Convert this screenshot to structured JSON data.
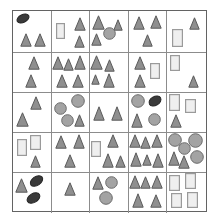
{
  "figure": {
    "kind": "shape-count-grid",
    "width": 217,
    "height": 221,
    "background_color": "#ffffff",
    "outer_border_color": "#636363",
    "grid_line_color": "#8c8c8c",
    "rows": 5,
    "columns": 5,
    "grid": {
      "left": 12,
      "top": 10,
      "width": 195,
      "height": 202,
      "row_heights": [
        42,
        40,
        40,
        40,
        40
      ],
      "column_widths": [
        39,
        39,
        39,
        39,
        39
      ]
    }
  },
  "palette": {
    "triangle_fill": "#8f8f8f",
    "triangle_stroke": "#5a5a5a",
    "circle_fill": "#a3a3a3",
    "circle_stroke": "#6b6b6b",
    "ellipse_fill": "#3a3a3a",
    "ellipse_stroke": "#262626",
    "rect_fill": "#efefef",
    "rect_stroke": "#9a9a9a"
  },
  "legend": {
    "shape_names": [
      "triangle",
      "circle",
      "ellipse",
      "rectangle"
    ]
  },
  "chart_data": {
    "type": "table",
    "title": "",
    "xlabel": "",
    "ylabel": "",
    "categories": [
      "triangle",
      "circle",
      "ellipse",
      "rectangle"
    ],
    "cells": [
      {
        "row": 1,
        "col": 1,
        "counts": {
          "triangle": 2,
          "circle": 0,
          "ellipse": 1,
          "rectangle": 0
        },
        "shapes": [
          {
            "type": "ellipse",
            "x": 3,
            "y": 3,
            "w": 14,
            "h": 9,
            "rot": -25
          },
          {
            "type": "triangle",
            "x": 7,
            "y": 22,
            "w": 12,
            "h": 14
          },
          {
            "type": "triangle",
            "x": 21,
            "y": 22,
            "w": 12,
            "h": 14
          }
        ]
      },
      {
        "row": 1,
        "col": 2,
        "counts": {
          "triangle": 2,
          "circle": 0,
          "ellipse": 0,
          "rectangle": 1
        },
        "shapes": [
          {
            "type": "rect",
            "x": 4,
            "y": 12,
            "w": 9,
            "h": 16
          },
          {
            "type": "triangle",
            "x": 22,
            "y": 6,
            "w": 12,
            "h": 14
          },
          {
            "type": "triangle",
            "x": 22,
            "y": 24,
            "w": 11,
            "h": 13
          }
        ]
      },
      {
        "row": 1,
        "col": 3,
        "counts": {
          "triangle": 3,
          "circle": 1,
          "ellipse": 0,
          "rectangle": 0
        },
        "shapes": [
          {
            "type": "triangle",
            "x": 2,
            "y": 4,
            "w": 13,
            "h": 15
          },
          {
            "type": "triangle",
            "x": 23,
            "y": 8,
            "w": 10,
            "h": 12
          },
          {
            "type": "circle",
            "x": 13,
            "y": 16,
            "w": 13,
            "h": 13
          },
          {
            "type": "triangle",
            "x": 1,
            "y": 22,
            "w": 11,
            "h": 13
          }
        ]
      },
      {
        "row": 1,
        "col": 4,
        "counts": {
          "triangle": 3,
          "circle": 0,
          "ellipse": 0,
          "rectangle": 0
        },
        "shapes": [
          {
            "type": "triangle",
            "x": 4,
            "y": 5,
            "w": 12,
            "h": 14
          },
          {
            "type": "triangle",
            "x": 21,
            "y": 4,
            "w": 12,
            "h": 14
          },
          {
            "type": "triangle",
            "x": 13,
            "y": 23,
            "w": 11,
            "h": 13
          }
        ]
      },
      {
        "row": 1,
        "col": 5,
        "counts": {
          "triangle": 1,
          "circle": 0,
          "ellipse": 0,
          "rectangle": 1
        },
        "shapes": [
          {
            "type": "triangle",
            "x": 22,
            "y": 6,
            "w": 11,
            "h": 13
          },
          {
            "type": "rect",
            "x": 5,
            "y": 18,
            "w": 11,
            "h": 18
          }
        ]
      },
      {
        "row": 2,
        "col": 1,
        "counts": {
          "triangle": 2,
          "circle": 0,
          "ellipse": 0,
          "rectangle": 0
        },
        "shapes": [
          {
            "type": "triangle",
            "x": 15,
            "y": 3,
            "w": 12,
            "h": 14
          },
          {
            "type": "triangle",
            "x": 12,
            "y": 21,
            "w": 12,
            "h": 14
          }
        ]
      },
      {
        "row": 2,
        "col": 2,
        "counts": {
          "triangle": 5,
          "circle": 0,
          "ellipse": 0,
          "rectangle": 0
        },
        "shapes": [
          {
            "type": "triangle",
            "x": 0,
            "y": 3,
            "w": 12,
            "h": 14
          },
          {
            "type": "triangle",
            "x": 11,
            "y": 5,
            "w": 11,
            "h": 13
          },
          {
            "type": "triangle",
            "x": 22,
            "y": 2,
            "w": 12,
            "h": 15
          },
          {
            "type": "triangle",
            "x": 4,
            "y": 21,
            "w": 12,
            "h": 14
          },
          {
            "type": "triangle",
            "x": 20,
            "y": 21,
            "w": 12,
            "h": 14
          }
        ]
      },
      {
        "row": 2,
        "col": 3,
        "counts": {
          "triangle": 4,
          "circle": 0,
          "ellipse": 0,
          "rectangle": 0
        },
        "shapes": [
          {
            "type": "triangle",
            "x": 0,
            "y": 2,
            "w": 13,
            "h": 15
          },
          {
            "type": "triangle",
            "x": 14,
            "y": 6,
            "w": 11,
            "h": 13
          },
          {
            "type": "triangle",
            "x": 1,
            "y": 21,
            "w": 9,
            "h": 11
          },
          {
            "type": "triangle",
            "x": 13,
            "y": 20,
            "w": 12,
            "h": 15
          }
        ]
      },
      {
        "row": 2,
        "col": 4,
        "counts": {
          "triangle": 2,
          "circle": 0,
          "ellipse": 0,
          "rectangle": 1
        },
        "shapes": [
          {
            "type": "triangle",
            "x": 5,
            "y": 3,
            "w": 12,
            "h": 14
          },
          {
            "type": "rect",
            "x": 21,
            "y": 10,
            "w": 10,
            "h": 16
          },
          {
            "type": "triangle",
            "x": 5,
            "y": 21,
            "w": 12,
            "h": 14
          }
        ]
      },
      {
        "row": 2,
        "col": 5,
        "counts": {
          "triangle": 1,
          "circle": 0,
          "ellipse": 0,
          "rectangle": 1
        },
        "shapes": [
          {
            "type": "rect",
            "x": 3,
            "y": 2,
            "w": 10,
            "h": 16
          },
          {
            "type": "triangle",
            "x": 21,
            "y": 22,
            "w": 11,
            "h": 13
          }
        ]
      },
      {
        "row": 3,
        "col": 1,
        "counts": {
          "triangle": 2,
          "circle": 0,
          "ellipse": 0,
          "rectangle": 0
        },
        "shapes": [
          {
            "type": "triangle",
            "x": 17,
            "y": 3,
            "w": 12,
            "h": 14
          },
          {
            "type": "triangle",
            "x": 3,
            "y": 19,
            "w": 13,
            "h": 15
          }
        ]
      },
      {
        "row": 3,
        "col": 2,
        "counts": {
          "triangle": 1,
          "circle": 3,
          "ellipse": 0,
          "rectangle": 0
        },
        "shapes": [
          {
            "type": "circle",
            "x": 19,
            "y": 1,
            "w": 14,
            "h": 14
          },
          {
            "type": "circle",
            "x": 2,
            "y": 9,
            "w": 13,
            "h": 13
          },
          {
            "type": "circle",
            "x": 9,
            "y": 21,
            "w": 13,
            "h": 13
          },
          {
            "type": "triangle",
            "x": 22,
            "y": 21,
            "w": 11,
            "h": 13
          }
        ]
      },
      {
        "row": 3,
        "col": 3,
        "counts": {
          "triangle": 2,
          "circle": 0,
          "ellipse": 0,
          "rectangle": 0
        },
        "shapes": [
          {
            "type": "triangle",
            "x": 3,
            "y": 13,
            "w": 12,
            "h": 15
          },
          {
            "type": "triangle",
            "x": 21,
            "y": 13,
            "w": 12,
            "h": 15
          }
        ]
      },
      {
        "row": 3,
        "col": 4,
        "counts": {
          "triangle": 1,
          "circle": 2,
          "ellipse": 1,
          "rectangle": 0
        },
        "shapes": [
          {
            "type": "circle",
            "x": 2,
            "y": 1,
            "w": 14,
            "h": 14
          },
          {
            "type": "ellipse",
            "x": 19,
            "y": 3,
            "w": 14,
            "h": 10,
            "rot": -30
          },
          {
            "type": "triangle",
            "x": 2,
            "y": 20,
            "w": 12,
            "h": 15
          },
          {
            "type": "circle",
            "x": 19,
            "y": 20,
            "w": 13,
            "h": 13
          }
        ]
      },
      {
        "row": 3,
        "col": 5,
        "counts": {
          "triangle": 1,
          "circle": 0,
          "ellipse": 0,
          "rectangle": 2
        },
        "shapes": [
          {
            "type": "rect",
            "x": 2,
            "y": 1,
            "w": 11,
            "h": 17
          },
          {
            "type": "rect",
            "x": 18,
            "y": 6,
            "w": 11,
            "h": 14
          },
          {
            "type": "triangle",
            "x": 3,
            "y": 21,
            "w": 12,
            "h": 14
          }
        ]
      },
      {
        "row": 4,
        "col": 1,
        "counts": {
          "triangle": 1,
          "circle": 0,
          "ellipse": 0,
          "rectangle": 2
        },
        "shapes": [
          {
            "type": "rect",
            "x": 4,
            "y": 6,
            "w": 10,
            "h": 17
          },
          {
            "type": "rect",
            "x": 17,
            "y": 2,
            "w": 11,
            "h": 15
          },
          {
            "type": "triangle",
            "x": 17,
            "y": 22,
            "w": 11,
            "h": 13
          }
        ]
      },
      {
        "row": 4,
        "col": 2,
        "counts": {
          "triangle": 3,
          "circle": 0,
          "ellipse": 0,
          "rectangle": 0
        },
        "shapes": [
          {
            "type": "triangle",
            "x": 3,
            "y": 2,
            "w": 12,
            "h": 14
          },
          {
            "type": "triangle",
            "x": 21,
            "y": 1,
            "w": 12,
            "h": 15
          },
          {
            "type": "triangle",
            "x": 12,
            "y": 21,
            "w": 12,
            "h": 14
          }
        ]
      },
      {
        "row": 4,
        "col": 3,
        "counts": {
          "triangle": 3,
          "circle": 0,
          "ellipse": 0,
          "rectangle": 1
        },
        "shapes": [
          {
            "type": "rect",
            "x": 1,
            "y": 8,
            "w": 10,
            "h": 16
          },
          {
            "type": "triangle",
            "x": 17,
            "y": 1,
            "w": 12,
            "h": 14
          },
          {
            "type": "triangle",
            "x": 12,
            "y": 20,
            "w": 12,
            "h": 15
          },
          {
            "type": "triangle",
            "x": 25,
            "y": 22,
            "w": 11,
            "h": 13
          }
        ]
      },
      {
        "row": 4,
        "col": 4,
        "counts": {
          "triangle": 6,
          "circle": 0,
          "ellipse": 0,
          "rectangle": 0
        },
        "shapes": [
          {
            "type": "triangle",
            "x": 0,
            "y": 1,
            "w": 12,
            "h": 14
          },
          {
            "type": "triangle",
            "x": 11,
            "y": 3,
            "w": 11,
            "h": 13
          },
          {
            "type": "triangle",
            "x": 22,
            "y": 1,
            "w": 12,
            "h": 14
          },
          {
            "type": "triangle",
            "x": 1,
            "y": 19,
            "w": 12,
            "h": 15
          },
          {
            "type": "triangle",
            "x": 13,
            "y": 21,
            "w": 10,
            "h": 12
          },
          {
            "type": "triangle",
            "x": 23,
            "y": 20,
            "w": 12,
            "h": 15
          }
        ]
      },
      {
        "row": 4,
        "col": 5,
        "counts": {
          "triangle": 2,
          "circle": 4,
          "ellipse": 0,
          "rectangle": 0
        },
        "shapes": [
          {
            "type": "circle",
            "x": 1,
            "y": 0,
            "w": 14,
            "h": 14
          },
          {
            "type": "circle",
            "x": 21,
            "y": 0,
            "w": 15,
            "h": 15
          },
          {
            "type": "circle",
            "x": 11,
            "y": 9,
            "w": 13,
            "h": 13
          },
          {
            "type": "circle",
            "x": 23,
            "y": 17,
            "w": 14,
            "h": 14
          },
          {
            "type": "triangle",
            "x": 1,
            "y": 18,
            "w": 12,
            "h": 15
          },
          {
            "type": "triangle",
            "x": 11,
            "y": 22,
            "w": 12,
            "h": 14
          }
        ]
      },
      {
        "row": 5,
        "col": 1,
        "counts": {
          "triangle": 1,
          "circle": 0,
          "ellipse": 2,
          "rectangle": 0
        },
        "shapes": [
          {
            "type": "triangle",
            "x": 2,
            "y": 5,
            "w": 13,
            "h": 15
          },
          {
            "type": "ellipse",
            "x": 16,
            "y": 3,
            "w": 15,
            "h": 10,
            "rot": -35
          },
          {
            "type": "ellipse",
            "x": 13,
            "y": 20,
            "w": 15,
            "h": 10,
            "rot": -30
          }
        ]
      },
      {
        "row": 5,
        "col": 2,
        "counts": {
          "triangle": 1,
          "circle": 0,
          "ellipse": 0,
          "rectangle": 0
        },
        "shapes": [
          {
            "type": "triangle",
            "x": 12,
            "y": 9,
            "w": 12,
            "h": 14
          }
        ]
      },
      {
        "row": 5,
        "col": 3,
        "counts": {
          "triangle": 1,
          "circle": 2,
          "ellipse": 0,
          "rectangle": 0
        },
        "shapes": [
          {
            "type": "triangle",
            "x": 2,
            "y": 3,
            "w": 12,
            "h": 14
          },
          {
            "type": "circle",
            "x": 15,
            "y": 3,
            "w": 13,
            "h": 13
          },
          {
            "type": "circle",
            "x": 9,
            "y": 18,
            "w": 14,
            "h": 14
          }
        ]
      },
      {
        "row": 5,
        "col": 4,
        "counts": {
          "triangle": 5,
          "circle": 0,
          "ellipse": 0,
          "rectangle": 0
        },
        "shapes": [
          {
            "type": "triangle",
            "x": 0,
            "y": 2,
            "w": 12,
            "h": 14
          },
          {
            "type": "triangle",
            "x": 11,
            "y": 3,
            "w": 11,
            "h": 13
          },
          {
            "type": "triangle",
            "x": 22,
            "y": 2,
            "w": 12,
            "h": 14
          },
          {
            "type": "triangle",
            "x": 3,
            "y": 20,
            "w": 12,
            "h": 15
          },
          {
            "type": "triangle",
            "x": 21,
            "y": 21,
            "w": 12,
            "h": 14
          }
        ]
      },
      {
        "row": 5,
        "col": 5,
        "counts": {
          "triangle": 0,
          "circle": 0,
          "ellipse": 0,
          "rectangle": 4
        },
        "shapes": [
          {
            "type": "rect",
            "x": 2,
            "y": 2,
            "w": 11,
            "h": 16
          },
          {
            "type": "rect",
            "x": 18,
            "y": 0,
            "w": 11,
            "h": 16
          },
          {
            "type": "rect",
            "x": 4,
            "y": 20,
            "w": 11,
            "h": 15
          },
          {
            "type": "rect",
            "x": 20,
            "y": 19,
            "w": 11,
            "h": 16
          }
        ]
      }
    ],
    "totals": {
      "triangle": 55,
      "circle": 12,
      "ellipse": 5,
      "rectangle": 14
    }
  }
}
